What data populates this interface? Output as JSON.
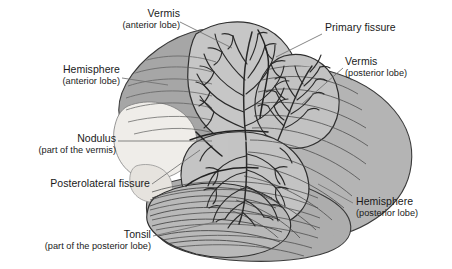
{
  "figure": {
    "background_color": "#ffffff",
    "colors": {
      "outline": "#2b2b2b",
      "folia_line": "#333333",
      "cortex_light": "#c8c8c8",
      "cortex_mid": "#b0b0b0",
      "cortex_dark": "#9a9a9a",
      "anterior_shade": "#a8a8a8",
      "nodulus_pale": "#eeece8",
      "leader_line": "#6e6e6e",
      "text": "#1a1a1a"
    }
  },
  "labels": [
    {
      "id": "vermis-anterior",
      "main": "Vermis",
      "sub": "(anterior lobe)",
      "align": "right",
      "x": 105,
      "y": 8,
      "leader": [
        [
          180,
          22
        ],
        [
          232,
          48
        ]
      ]
    },
    {
      "id": "primary-fissure",
      "main": "Primary fissure",
      "sub": "",
      "align": "left",
      "x": 325,
      "y": 27,
      "leader": [
        [
          322,
          34
        ],
        [
          276,
          57
        ]
      ]
    },
    {
      "id": "vermis-posterior",
      "main": "Vermis",
      "sub": "(posterior lobe)",
      "align": "left",
      "x": 345,
      "y": 58,
      "leader": [
        [
          343,
          68
        ],
        [
          302,
          104
        ]
      ]
    },
    {
      "id": "hemisphere-anterior",
      "main": "Hemisphere",
      "sub": "(anterior lobe)",
      "align": "right",
      "x": 38,
      "y": 66,
      "leader": [
        [
          122,
          78
        ],
        [
          168,
          85
        ]
      ]
    },
    {
      "id": "nodulus",
      "main": "Nodulus",
      "sub": "(part of the vermis)",
      "align": "right",
      "x": 22,
      "y": 135,
      "leader": [
        [
          118,
          141
        ],
        [
          212,
          141
        ]
      ]
    },
    {
      "id": "posterolateral-fissure",
      "main": "Posterolateral fissure",
      "sub": "",
      "align": "right",
      "x": 30,
      "y": 180,
      "leader": [
        [
          152,
          184
        ],
        [
          200,
          150
        ]
      ]
    },
    {
      "id": "hemisphere-posterior",
      "main": "Hemisphere",
      "sub": "(posterior lobe)",
      "align": "left",
      "x": 356,
      "y": 198,
      "leader": [
        [
          353,
          203
        ],
        [
          318,
          184
        ]
      ]
    },
    {
      "id": "tonsil",
      "main": "Tonsil",
      "sub": "(part of the posterior lobe)",
      "align": "right",
      "x": 14,
      "y": 230,
      "leader": [
        [
          153,
          236
        ],
        [
          215,
          222
        ]
      ]
    }
  ]
}
